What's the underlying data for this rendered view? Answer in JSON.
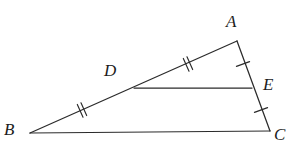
{
  "figure": {
    "background_color": "#ffffff",
    "stroke_color": "#2b2b2b",
    "label_color": "#1c1c1c",
    "width": 296,
    "height": 151
  },
  "vertices": [
    {
      "id": "A",
      "label": "A",
      "x": 237,
      "y": 41,
      "label_x": 226,
      "label_y": 13
    },
    {
      "id": "B",
      "label": "B",
      "x": 30,
      "y": 133,
      "label_x": 4,
      "label_y": 121
    },
    {
      "id": "C",
      "label": "C",
      "x": 270,
      "y": 131,
      "label_x": 274,
      "label_y": 126
    },
    {
      "id": "D",
      "label": "D",
      "x": 134,
      "y": 88,
      "label_x": 104,
      "label_y": 62
    },
    {
      "id": "E",
      "label": "E",
      "x": 252,
      "y": 88,
      "label_x": 263,
      "label_y": 76
    }
  ],
  "segments": [
    {
      "id": "AB",
      "from": "B",
      "to": "A",
      "x1": 30,
      "y1": 133,
      "x2": 237,
      "y2": 41,
      "ticks": 0
    },
    {
      "id": "BC",
      "from": "B",
      "to": "C",
      "x1": 30,
      "y1": 133,
      "x2": 270,
      "y2": 131,
      "ticks": 0
    },
    {
      "id": "AC",
      "from": "A",
      "to": "C",
      "x1": 237,
      "y1": 41,
      "x2": 270,
      "y2": 131,
      "ticks": 0
    },
    {
      "id": "DE",
      "from": "D",
      "to": "E",
      "x1": 134,
      "y1": 88,
      "x2": 252,
      "y2": 88,
      "ticks": 0
    }
  ],
  "congruence_marks": [
    {
      "id": "mark-BD",
      "on_segment": "BD",
      "count": 2,
      "cx": 82,
      "cy": 110,
      "angle_deg": -24
    },
    {
      "id": "mark-DA",
      "on_segment": "DA",
      "count": 2,
      "cx": 188,
      "cy": 64,
      "angle_deg": -24
    },
    {
      "id": "mark-AE",
      "on_segment": "AE",
      "count": 1,
      "cx": 243,
      "cy": 64,
      "angle_deg": 70
    },
    {
      "id": "mark-EC",
      "on_segment": "EC",
      "count": 1,
      "cx": 261,
      "cy": 110,
      "angle_deg": 70
    }
  ]
}
